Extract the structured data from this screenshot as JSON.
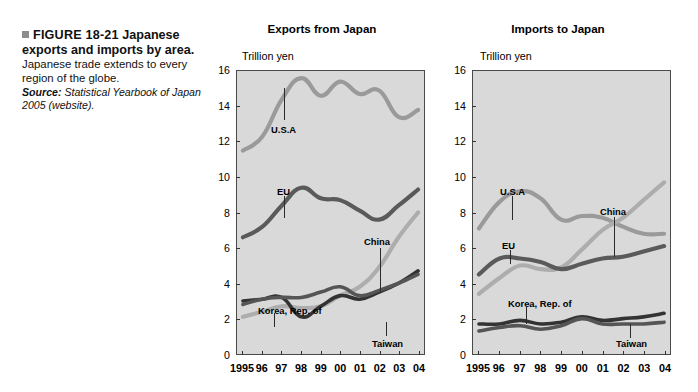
{
  "caption": {
    "figure_number": "FIGURE 18-21",
    "title": "Japanese exports and imports by area.",
    "body": "Japanese trade extends to every region of the globe.",
    "source_label": "Source:",
    "source_text": "Statistical Yearbook of Japan 2005 (website)."
  },
  "colors": {
    "plot_background": "#d9d9d9",
    "axis": "#4a4a4a",
    "usa": "#9a9a9a",
    "eu": "#5a5a5a",
    "china": "#adadad",
    "korea": "#333333",
    "taiwan": "#555555"
  },
  "axis": {
    "y_label": "Trillion yen",
    "y_ticks": [
      "16",
      "14",
      "12",
      "10",
      "8",
      "6",
      "4",
      "2",
      "0"
    ],
    "y_tick_values": [
      16,
      14,
      12,
      10,
      8,
      6,
      4,
      2,
      0
    ],
    "x_ticks": [
      "1995",
      "96",
      "97",
      "98",
      "99",
      "00",
      "01",
      "02",
      "03",
      "04"
    ]
  },
  "chart_data": [
    {
      "type": "line",
      "title": "Exports from Japan",
      "xlabel": "",
      "ylabel": "Trillion yen",
      "ylim": [
        0,
        16
      ],
      "grid": false,
      "legend": "inline-annotations",
      "x": [
        1995,
        1996,
        1997,
        1998,
        1999,
        2000,
        2001,
        2002,
        2003,
        2004
      ],
      "x_tick_labels": [
        "1995",
        "96",
        "97",
        "98",
        "99",
        "00",
        "01",
        "02",
        "03",
        "04"
      ],
      "series": [
        {
          "name": "U.S.A",
          "values": [
            11.5,
            12.3,
            14.4,
            15.6,
            14.6,
            15.4,
            14.7,
            14.9,
            13.4,
            13.8
          ]
        },
        {
          "name": "EU",
          "values": [
            6.6,
            7.2,
            8.4,
            9.4,
            8.8,
            8.7,
            8.1,
            7.6,
            8.4,
            9.3
          ]
        },
        {
          "name": "China",
          "values": [
            2.1,
            2.4,
            2.7,
            2.6,
            2.7,
            3.3,
            3.8,
            4.9,
            6.6,
            8.0
          ]
        },
        {
          "name": "Korea, Rep. of",
          "values": [
            3.0,
            3.1,
            3.2,
            2.1,
            2.7,
            3.3,
            3.1,
            3.5,
            4.0,
            4.7
          ]
        },
        {
          "name": "Taiwan",
          "values": [
            2.8,
            3.1,
            3.2,
            3.2,
            3.5,
            3.8,
            3.3,
            3.6,
            4.0,
            4.5
          ]
        }
      ],
      "annotations": [
        {
          "label": "U.S.A"
        },
        {
          "label": "EU"
        },
        {
          "label": "China"
        },
        {
          "label": "Korea, Rep. of"
        },
        {
          "label": "Taiwan"
        }
      ]
    },
    {
      "type": "line",
      "title": "Imports to Japan",
      "xlabel": "",
      "ylabel": "Trillion yen",
      "ylim": [
        0,
        16
      ],
      "grid": false,
      "legend": "inline-annotations",
      "x": [
        1995,
        1996,
        1997,
        1998,
        1999,
        2000,
        2001,
        2002,
        2003,
        2004
      ],
      "x_tick_labels": [
        "1995",
        "96",
        "97",
        "98",
        "99",
        "00",
        "01",
        "02",
        "03",
        "04"
      ],
      "series": [
        {
          "name": "U.S.A",
          "values": [
            7.1,
            8.6,
            9.2,
            8.8,
            7.6,
            7.8,
            7.7,
            7.2,
            6.8,
            6.8
          ]
        },
        {
          "name": "China",
          "values": [
            3.4,
            4.3,
            5.0,
            4.8,
            4.9,
            5.9,
            7.0,
            7.7,
            8.7,
            9.7
          ]
        },
        {
          "name": "EU",
          "values": [
            4.5,
            5.4,
            5.4,
            5.2,
            4.8,
            5.1,
            5.4,
            5.5,
            5.8,
            6.1
          ]
        },
        {
          "name": "Korea, Rep. of",
          "values": [
            1.7,
            1.7,
            1.9,
            1.7,
            1.8,
            2.1,
            1.9,
            2.0,
            2.1,
            2.3
          ]
        },
        {
          "name": "Taiwan",
          "values": [
            1.3,
            1.5,
            1.6,
            1.4,
            1.6,
            2.0,
            1.7,
            1.7,
            1.7,
            1.8
          ]
        }
      ],
      "annotations": [
        {
          "label": "U.S.A"
        },
        {
          "label": "China"
        },
        {
          "label": "EU"
        },
        {
          "label": "Korea, Rep. of"
        },
        {
          "label": "Taiwan"
        }
      ]
    }
  ]
}
